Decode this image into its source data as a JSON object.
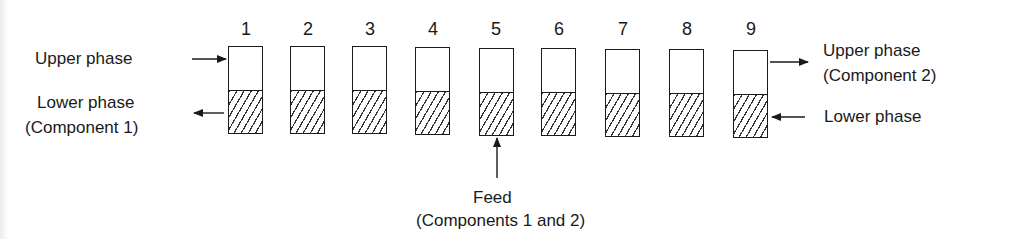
{
  "diagram": {
    "title": "",
    "stages": [
      {
        "number": "1"
      },
      {
        "number": "2"
      },
      {
        "number": "3"
      },
      {
        "number": "4"
      },
      {
        "number": "5"
      },
      {
        "number": "6"
      },
      {
        "number": "7"
      },
      {
        "number": "8"
      },
      {
        "number": "9"
      }
    ],
    "left_labels": {
      "upper_in": "Upper phase",
      "lower_out_line1": "Lower phase",
      "lower_out_line2": "(Component 1)"
    },
    "right_labels": {
      "upper_out_line1": "Upper phase",
      "upper_out_line2": "(Component 2)",
      "lower_in": "Lower phase"
    },
    "feed": {
      "line1": "Feed",
      "line2": "(Components 1 and 2)",
      "stage": "5"
    },
    "legend": {
      "upper_phase_fill": "white",
      "lower_phase_fill": "hatched"
    }
  }
}
